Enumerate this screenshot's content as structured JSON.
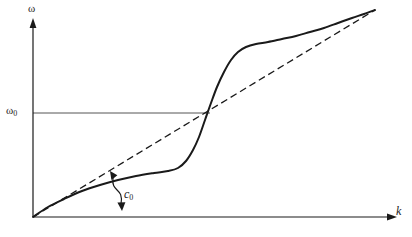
{
  "figure": {
    "kind": "dispersion-relation-plot",
    "background_color": "#ffffff",
    "ink_color": "#1a1a1a",
    "guide_color": "#555555"
  },
  "axes": {
    "y": {
      "symbol": "ω",
      "arrow": true,
      "x_px": 33,
      "top_px": 25,
      "bottom_px": 217
    },
    "x": {
      "symbol": "k",
      "arrow": true,
      "y_px": 217,
      "left_px": 33,
      "right_px": 390
    }
  },
  "reference_line": {
    "label": "ω",
    "label_subscript": "0",
    "value_y_px": 113,
    "from_x_px": 33,
    "to_x_px": 210,
    "style": "solid-thin"
  },
  "annotation": {
    "label": "c",
    "label_subscript": "0",
    "meaning": "slope-of-dashed-line",
    "arrow_style": "curved-double-headed",
    "label_x_px": 128,
    "label_y_px": 196
  },
  "chart_data": {
    "type": "line",
    "title": "",
    "xlabel": "k",
    "ylabel": "ω",
    "grid": false,
    "legend": null,
    "xlim": [
      0,
      390
    ],
    "ylim": [
      0,
      237
    ],
    "axis_ticks": {
      "x": [],
      "y": [
        "ω₀"
      ]
    },
    "annotations": [
      {
        "text": "ω₀",
        "x_px": 20,
        "y_px": 113
      },
      {
        "text": "c₀",
        "x_px": 128,
        "y_px": 196
      },
      {
        "text": "ω",
        "x_px": 33,
        "y_px": 10
      },
      {
        "text": "k",
        "x_px": 400,
        "y_px": 211
      }
    ],
    "series": [
      {
        "name": "dispersion-curve",
        "style": "solid",
        "width_px": 2,
        "points": [
          [
            33,
            217
          ],
          [
            48,
            207
          ],
          [
            64,
            199
          ],
          [
            82,
            191
          ],
          [
            100,
            185
          ],
          [
            118,
            180
          ],
          [
            136,
            176
          ],
          [
            154,
            173
          ],
          [
            168,
            171
          ],
          [
            178,
            168
          ],
          [
            186,
            161
          ],
          [
            193,
            150
          ],
          [
            199,
            137
          ],
          [
            205,
            120
          ],
          [
            211,
            103
          ],
          [
            217,
            87
          ],
          [
            224,
            72
          ],
          [
            231,
            60
          ],
          [
            238,
            52
          ],
          [
            246,
            47
          ],
          [
            256,
            44
          ],
          [
            268,
            42
          ],
          [
            282,
            39
          ],
          [
            296,
            36
          ],
          [
            310,
            32
          ],
          [
            324,
            28
          ],
          [
            338,
            23
          ],
          [
            352,
            18
          ],
          [
            364,
            14
          ],
          [
            375,
            10
          ]
        ]
      },
      {
        "name": "c0-asymptote-line",
        "style": "dashed",
        "width_px": 1.3,
        "dash_pattern": "7,4",
        "points": [
          [
            33,
            217
          ],
          [
            375,
            10
          ]
        ]
      }
    ]
  }
}
